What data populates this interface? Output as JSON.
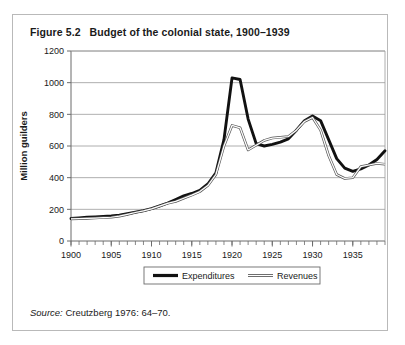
{
  "figure": {
    "number": "Figure 5.2",
    "title": "Budget of the colonial state, 1900–1939",
    "source_label": "Source:",
    "source_text": "Creutzberg 1976: 64–70."
  },
  "chart_data": {
    "type": "line",
    "title": "Budget of the colonial state, 1900–1939",
    "xlabel": "",
    "ylabel": "Million guilders",
    "xlim": [
      1900,
      1939
    ],
    "ylim": [
      0,
      1200
    ],
    "yticks": [
      0,
      200,
      400,
      600,
      800,
      1000,
      1200
    ],
    "xticks": [
      1900,
      1905,
      1910,
      1915,
      1920,
      1925,
      1930,
      1935
    ],
    "xtick_labels": [
      "1900",
      "1905",
      "1910",
      "1915",
      "1920",
      "1925",
      "1930",
      "1935"
    ],
    "ytick_labels": [
      "0",
      "200",
      "400",
      "600",
      "800",
      "1000",
      "1200"
    ],
    "minor_x_tick_step": 1,
    "grid": "horizontal",
    "legend_position": "below-axis",
    "x": [
      1900,
      1901,
      1902,
      1903,
      1904,
      1905,
      1906,
      1907,
      1908,
      1909,
      1910,
      1911,
      1912,
      1913,
      1914,
      1915,
      1916,
      1917,
      1918,
      1919,
      1920,
      1921,
      1922,
      1923,
      1924,
      1925,
      1926,
      1927,
      1928,
      1929,
      1930,
      1931,
      1932,
      1933,
      1934,
      1935,
      1936,
      1937,
      1938,
      1939
    ],
    "series": [
      {
        "name": "Expenditures",
        "style": "thick-black",
        "color": "#111111",
        "values": [
          142,
          146,
          150,
          152,
          155,
          158,
          163,
          172,
          182,
          192,
          205,
          222,
          240,
          262,
          285,
          300,
          320,
          360,
          430,
          640,
          1030,
          1020,
          770,
          615,
          600,
          610,
          625,
          645,
          700,
          760,
          790,
          760,
          640,
          520,
          460,
          440,
          455,
          480,
          515,
          570
        ]
      },
      {
        "name": "Revenues",
        "style": "thin-double",
        "color": "#555555",
        "values": [
          140,
          141,
          143,
          145,
          148,
          150,
          157,
          168,
          180,
          190,
          203,
          220,
          238,
          250,
          270,
          290,
          312,
          350,
          420,
          600,
          730,
          715,
          575,
          605,
          635,
          650,
          655,
          660,
          700,
          755,
          780,
          700,
          540,
          420,
          395,
          400,
          470,
          480,
          490,
          485
        ]
      }
    ],
    "legend": [
      {
        "label": "Expenditures",
        "style": "thick-black"
      },
      {
        "label": "Revenues",
        "style": "thin-double"
      }
    ]
  }
}
